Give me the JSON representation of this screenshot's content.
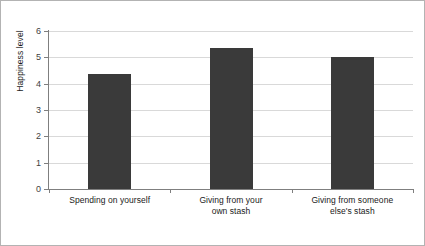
{
  "chart_data": {
    "type": "bar",
    "title": "",
    "subtitle": "",
    "xlabel": "",
    "ylabel": "Happiness level",
    "categories": [
      "Spending on yourself",
      "Giving from your own stash",
      "Giving from someone else's stash"
    ],
    "category_lines": [
      [
        "Spending on yourself"
      ],
      [
        "Giving from your",
        "own stash"
      ],
      [
        "Giving from someone",
        "else's stash"
      ]
    ],
    "values": [
      4.35,
      5.35,
      5.0
    ],
    "ylim": [
      0,
      6
    ],
    "ytick_labels": [
      "0",
      "1",
      "2",
      "3",
      "4",
      "5",
      "6"
    ],
    "ytick_values": [
      0,
      1,
      2,
      3,
      4,
      5,
      6
    ],
    "grid": true,
    "legend": false,
    "legend_position": "none",
    "bar_color": "#3a3a3a",
    "gridline_color": "#d9d9d9",
    "axis_color": "#7f7f7f",
    "frame_color": "#b3b3b3",
    "background_color": "#ffffff"
  }
}
